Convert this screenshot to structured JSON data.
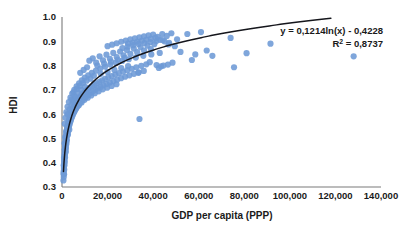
{
  "chart_data": {
    "type": "scatter",
    "title": "",
    "xlabel": "GDP per capita (PPP)",
    "ylabel": "HDI",
    "xlim": [
      0,
      140000
    ],
    "ylim": [
      0.3,
      1.0
    ],
    "grid": false,
    "legend": null,
    "x_ticks": [
      "0",
      "20,000",
      "40,000",
      "60,000",
      "80,000",
      "100,000",
      "120,000",
      "140,000"
    ],
    "x_tick_values": [
      0,
      20000,
      40000,
      60000,
      80000,
      100000,
      120000,
      140000
    ],
    "y_ticks": [
      "0.3",
      "0.4",
      "0.5",
      "0.6",
      "0.7",
      "0.8",
      "0.9",
      "1.0"
    ],
    "y_tick_values": [
      0.3,
      0.4,
      0.5,
      0.6,
      0.7,
      0.8,
      0.9,
      1.0
    ],
    "marker_color": "#6d9ad6",
    "trendline_color": "#15161c",
    "annotations": {
      "equation": "y = 0,1214ln(x) - 0,4228",
      "r_squared_prefix": "R",
      "r_squared_sup": "2",
      "r_squared_value": " = 0,8737"
    },
    "trendline": {
      "type": "logarithmic",
      "slope": 0.1214,
      "intercept": -0.4228,
      "r_squared": 0.8737,
      "equation_display": "y = 0,1214ln(x) - 0,4228"
    },
    "points": [
      [
        620,
        0.327
      ],
      [
        700,
        0.352
      ],
      [
        760,
        0.341
      ],
      [
        820,
        0.368
      ],
      [
        880,
        0.383
      ],
      [
        900,
        0.352
      ],
      [
        950,
        0.397
      ],
      [
        980,
        0.372
      ],
      [
        1020,
        0.412
      ],
      [
        1060,
        0.39
      ],
      [
        1100,
        0.428
      ],
      [
        1150,
        0.405
      ],
      [
        1180,
        0.442
      ],
      [
        1220,
        0.42
      ],
      [
        1260,
        0.455
      ],
      [
        1300,
        0.435
      ],
      [
        1340,
        0.468
      ],
      [
        1380,
        0.448
      ],
      [
        1420,
        0.478
      ],
      [
        1460,
        0.458
      ],
      [
        1500,
        0.487
      ],
      [
        1560,
        0.465
      ],
      [
        1600,
        0.497
      ],
      [
        1650,
        0.475
      ],
      [
        1700,
        0.505
      ],
      [
        1760,
        0.483
      ],
      [
        1820,
        0.513
      ],
      [
        1880,
        0.492
      ],
      [
        1940,
        0.521
      ],
      [
        2000,
        0.5
      ],
      [
        2060,
        0.53
      ],
      [
        2120,
        0.508
      ],
      [
        2200,
        0.538
      ],
      [
        2280,
        0.516
      ],
      [
        2360,
        0.546
      ],
      [
        2440,
        0.524
      ],
      [
        2520,
        0.553
      ],
      [
        2600,
        0.532
      ],
      [
        2700,
        0.56
      ],
      [
        2800,
        0.54
      ],
      [
        2900,
        0.568
      ],
      [
        3000,
        0.547
      ],
      [
        3100,
        0.575
      ],
      [
        3200,
        0.554
      ],
      [
        3300,
        0.582
      ],
      [
        3400,
        0.561
      ],
      [
        3500,
        0.59
      ],
      [
        3600,
        0.568
      ],
      [
        3750,
        0.598
      ],
      [
        3900,
        0.575
      ],
      [
        4000,
        0.605
      ],
      [
        4150,
        0.583
      ],
      [
        4300,
        0.612
      ],
      [
        4450,
        0.59
      ],
      [
        4600,
        0.618
      ],
      [
        4750,
        0.597
      ],
      [
        4900,
        0.625
      ],
      [
        5050,
        0.604
      ],
      [
        5200,
        0.632
      ],
      [
        5400,
        0.61
      ],
      [
        5600,
        0.639
      ],
      [
        5800,
        0.617
      ],
      [
        6000,
        0.645
      ],
      [
        6200,
        0.624
      ],
      [
        6400,
        0.652
      ],
      [
        6600,
        0.63
      ],
      [
        6800,
        0.658
      ],
      [
        7000,
        0.637
      ],
      [
        7300,
        0.665
      ],
      [
        7600,
        0.643
      ],
      [
        7900,
        0.671
      ],
      [
        8200,
        0.65
      ],
      [
        8500,
        0.678
      ],
      [
        8800,
        0.657
      ],
      [
        9100,
        0.684
      ],
      [
        9400,
        0.663
      ],
      [
        9800,
        0.69
      ],
      [
        10200,
        0.669
      ],
      [
        10600,
        0.697
      ],
      [
        11000,
        0.676
      ],
      [
        11400,
        0.703
      ],
      [
        11800,
        0.682
      ],
      [
        12200,
        0.709
      ],
      [
        12700,
        0.688
      ],
      [
        13200,
        0.715
      ],
      [
        13700,
        0.695
      ],
      [
        14200,
        0.721
      ],
      [
        14700,
        0.7
      ],
      [
        15200,
        0.727
      ],
      [
        15800,
        0.707
      ],
      [
        16400,
        0.733
      ],
      [
        17000,
        0.712
      ],
      [
        17600,
        0.739
      ],
      [
        18200,
        0.719
      ],
      [
        18900,
        0.745
      ],
      [
        19600,
        0.724
      ],
      [
        20300,
        0.751
      ],
      [
        21000,
        0.73
      ],
      [
        21800,
        0.757
      ],
      [
        22600,
        0.736
      ],
      [
        23400,
        0.763
      ],
      [
        24200,
        0.742
      ],
      [
        25000,
        0.769
      ],
      [
        25900,
        0.748
      ],
      [
        26800,
        0.775
      ],
      [
        27700,
        0.754
      ],
      [
        28600,
        0.781
      ],
      [
        29600,
        0.76
      ],
      [
        30600,
        0.787
      ],
      [
        31600,
        0.766
      ],
      [
        32600,
        0.793
      ],
      [
        33700,
        0.772
      ],
      [
        34800,
        0.799
      ],
      [
        35900,
        0.778
      ],
      [
        37000,
        0.805
      ],
      [
        1200,
        0.56
      ],
      [
        1500,
        0.585
      ],
      [
        1900,
        0.608
      ],
      [
        2400,
        0.63
      ],
      [
        3000,
        0.65
      ],
      [
        3700,
        0.668
      ],
      [
        4500,
        0.685
      ],
      [
        5400,
        0.7
      ],
      [
        6400,
        0.714
      ],
      [
        7500,
        0.727
      ],
      [
        8700,
        0.739
      ],
      [
        10000,
        0.75
      ],
      [
        11500,
        0.76
      ],
      [
        13100,
        0.77
      ],
      [
        14900,
        0.779
      ],
      [
        16800,
        0.788
      ],
      [
        18900,
        0.796
      ],
      [
        21200,
        0.804
      ],
      [
        23700,
        0.812
      ],
      [
        26400,
        0.819
      ],
      [
        29300,
        0.826
      ],
      [
        32400,
        0.833
      ],
      [
        35700,
        0.84
      ],
      [
        39200,
        0.846
      ],
      [
        42900,
        0.852
      ],
      [
        1100,
        0.48
      ],
      [
        1400,
        0.505
      ],
      [
        1800,
        0.528
      ],
      [
        2300,
        0.548
      ],
      [
        2900,
        0.566
      ],
      [
        3600,
        0.583
      ],
      [
        4400,
        0.598
      ],
      [
        5300,
        0.612
      ],
      [
        6300,
        0.625
      ],
      [
        7400,
        0.637
      ],
      [
        8600,
        0.648
      ],
      [
        9900,
        0.659
      ],
      [
        11300,
        0.668
      ],
      [
        12800,
        0.677
      ],
      [
        14400,
        0.686
      ],
      [
        16100,
        0.694
      ],
      [
        17900,
        0.702
      ],
      [
        19800,
        0.709
      ],
      [
        21800,
        0.716
      ],
      [
        23900,
        0.723
      ],
      [
        12000,
        0.82
      ],
      [
        13500,
        0.83
      ],
      [
        15000,
        0.812
      ],
      [
        16500,
        0.838
      ],
      [
        18000,
        0.822
      ],
      [
        19500,
        0.845
      ],
      [
        21000,
        0.828
      ],
      [
        22500,
        0.852
      ],
      [
        24000,
        0.835
      ],
      [
        25500,
        0.858
      ],
      [
        27000,
        0.842
      ],
      [
        28500,
        0.864
      ],
      [
        30000,
        0.848
      ],
      [
        31500,
        0.87
      ],
      [
        33000,
        0.855
      ],
      [
        34500,
        0.876
      ],
      [
        36000,
        0.862
      ],
      [
        37500,
        0.882
      ],
      [
        39000,
        0.868
      ],
      [
        40500,
        0.888
      ],
      [
        20000,
        0.88
      ],
      [
        22000,
        0.886
      ],
      [
        24000,
        0.892
      ],
      [
        26000,
        0.898
      ],
      [
        28000,
        0.903
      ],
      [
        30000,
        0.908
      ],
      [
        32000,
        0.912
      ],
      [
        34000,
        0.916
      ],
      [
        36000,
        0.92
      ],
      [
        38000,
        0.924
      ],
      [
        40000,
        0.928
      ],
      [
        42000,
        0.918
      ],
      [
        44000,
        0.93
      ],
      [
        46000,
        0.922
      ],
      [
        48000,
        0.933
      ],
      [
        29000,
        0.89
      ],
      [
        31000,
        0.894
      ],
      [
        33000,
        0.898
      ],
      [
        35000,
        0.902
      ],
      [
        37000,
        0.906
      ],
      [
        39000,
        0.91
      ],
      [
        41000,
        0.914
      ],
      [
        43000,
        0.906
      ],
      [
        45000,
        0.9
      ],
      [
        47000,
        0.894
      ],
      [
        26500,
        0.872
      ],
      [
        28800,
        0.878
      ],
      [
        31200,
        0.884
      ],
      [
        33600,
        0.889
      ],
      [
        36200,
        0.893
      ],
      [
        38800,
        0.897
      ],
      [
        41400,
        0.901
      ],
      [
        44200,
        0.905
      ],
      [
        46800,
        0.887
      ],
      [
        49500,
        0.88
      ],
      [
        8000,
        0.77
      ],
      [
        9500,
        0.782
      ],
      [
        11000,
        0.793
      ],
      [
        12500,
        0.746
      ],
      [
        14000,
        0.758
      ],
      [
        15500,
        0.8
      ],
      [
        17000,
        0.766
      ],
      [
        18500,
        0.808
      ],
      [
        20000,
        0.774
      ],
      [
        21500,
        0.816
      ],
      [
        23000,
        0.782
      ],
      [
        24500,
        0.824
      ],
      [
        26000,
        0.79
      ],
      [
        27500,
        0.832
      ],
      [
        29000,
        0.798
      ],
      [
        5000,
        0.69
      ],
      [
        6500,
        0.704
      ],
      [
        7800,
        0.716
      ],
      [
        9200,
        0.728
      ],
      [
        10800,
        0.738
      ],
      [
        4200,
        0.66
      ],
      [
        5500,
        0.674
      ],
      [
        6900,
        0.688
      ],
      [
        8400,
        0.7
      ],
      [
        10100,
        0.712
      ],
      [
        2500,
        0.6
      ],
      [
        3300,
        0.62
      ],
      [
        4100,
        0.638
      ],
      [
        5000,
        0.654
      ],
      [
        6100,
        0.668
      ],
      [
        1300,
        0.44
      ],
      [
        1700,
        0.462
      ],
      [
        2100,
        0.49
      ],
      [
        2600,
        0.515
      ],
      [
        3200,
        0.536
      ],
      [
        900,
        0.42
      ],
      [
        1150,
        0.452
      ],
      [
        1450,
        0.472
      ],
      [
        1850,
        0.495
      ],
      [
        2350,
        0.518
      ],
      [
        760,
        0.39
      ],
      [
        940,
        0.41
      ],
      [
        1180,
        0.432
      ],
      [
        1500,
        0.455
      ],
      [
        1950,
        0.478
      ],
      [
        680,
        0.36
      ],
      [
        840,
        0.378
      ],
      [
        1050,
        0.4
      ],
      [
        1320,
        0.422
      ],
      [
        1680,
        0.445
      ],
      [
        34000,
        0.58
      ],
      [
        33500,
        0.77
      ],
      [
        41500,
        0.802
      ],
      [
        43500,
        0.797
      ],
      [
        48500,
        0.812
      ],
      [
        55000,
        0.93
      ],
      [
        57000,
        0.823
      ],
      [
        61000,
        0.938
      ],
      [
        58500,
        0.846
      ],
      [
        50500,
        0.908
      ],
      [
        52000,
        0.856
      ],
      [
        63500,
        0.862
      ],
      [
        66000,
        0.84
      ],
      [
        74000,
        0.914
      ],
      [
        75500,
        0.793
      ],
      [
        81000,
        0.851
      ],
      [
        91500,
        0.89
      ],
      [
        128000,
        0.838
      ],
      [
        44500,
        0.8
      ],
      [
        46500,
        0.804
      ],
      [
        38500,
        0.814
      ],
      [
        42500,
        0.79
      ]
    ]
  }
}
